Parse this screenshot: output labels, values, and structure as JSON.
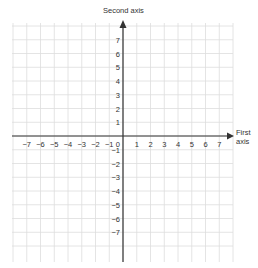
{
  "diagram": {
    "type": "cartesian-coordinate-plane",
    "y_axis_label": "Second axis",
    "x_axis_label_line1": "First",
    "x_axis_label_line2": "axis",
    "origin_label": "0",
    "x_ticks_negative": [
      "−7",
      "−6",
      "−5",
      "−4",
      "−3",
      "−2",
      "−1"
    ],
    "x_ticks_positive": [
      "1",
      "2",
      "3",
      "4",
      "5",
      "6",
      "7"
    ],
    "y_ticks_positive": [
      "1",
      "2",
      "3",
      "4",
      "5",
      "6",
      "7"
    ],
    "y_ticks_negative": [
      "−1",
      "−2",
      "−3",
      "−4",
      "−5",
      "−6",
      "−7"
    ],
    "range": {
      "x": [
        -8,
        8
      ],
      "y": [
        -8,
        8
      ]
    },
    "grid": true,
    "colors": {
      "axis": "#333333",
      "grid": "#dddddd",
      "text": "#333333"
    }
  }
}
